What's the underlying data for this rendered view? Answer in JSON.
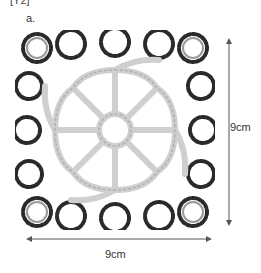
{
  "header": {
    "cut_text": "[Y2]",
    "figure_label": "a."
  },
  "figure": {
    "center_color": "#cfcfcf",
    "border_color": "#222222"
  },
  "dimensions": {
    "height_label": "9cm",
    "width_label": "9cm",
    "arrow_color": "#555555"
  }
}
